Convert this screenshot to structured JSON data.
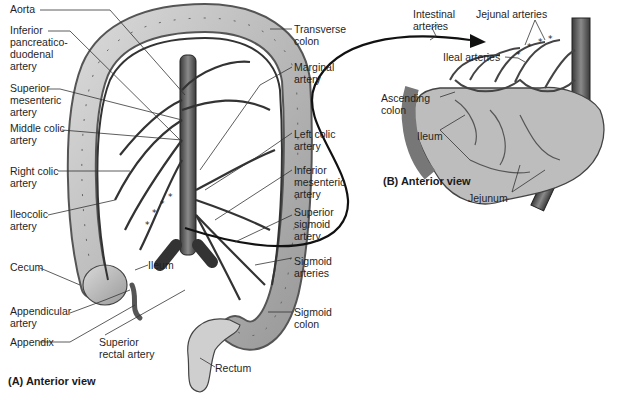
{
  "panel_a": {
    "caption": "(A) Anterior view",
    "labels": {
      "aorta": "Aorta",
      "inferior_pancreaticoduodenal": "Inferior\npancreatico-\nduodenal\nartery",
      "superior_mesenteric": "Superior\nmesenteric\nartery",
      "middle_colic": "Middle colic\nartery",
      "right_colic": "Right colic\nartery",
      "ileocolic": "Ileocolic\nartery",
      "cecum": "Cecum",
      "ileum": "Ileum",
      "appendicular": "Appendicular\nartery",
      "appendix": "Appendix",
      "superior_rectal": "Superior\nrectal artery",
      "rectum": "Rectum",
      "transverse_colon": "Transverse\ncolon",
      "marginal": "Marginal\nartery",
      "left_colic": "Left colic\nartery",
      "inferior_mesenteric": "Inferior\nmesenteric\nartery",
      "superior_sigmoid": "Superior\nsigmoid\nartery",
      "sigmoid_arteries": "Sigmoid\narteries",
      "sigmoid_colon": "Sigmoid\ncolon"
    }
  },
  "panel_b": {
    "caption": "(B) Anterior view",
    "labels": {
      "intestinal_arteries": "Intestinal\narteries",
      "jejunal_arteries": "Jejunal arteries",
      "ileal_arteries": "Ileal arteries",
      "ascending_colon": "Ascending\ncolon",
      "ileum": "Ileum",
      "jejunum": "Jejunum"
    }
  }
}
